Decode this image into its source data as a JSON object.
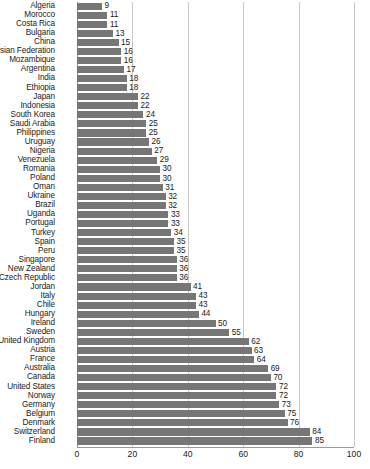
{
  "chart_data": {
    "type": "bar",
    "orientation": "horizontal",
    "title": "",
    "subtitle": "",
    "xlabel": "",
    "ylabel": "",
    "xlim": [
      0,
      100
    ],
    "xticks": [
      0,
      20,
      40,
      60,
      80,
      100
    ],
    "grid": true,
    "legend": null,
    "bar_color": "#767676",
    "gridline_color": "#c8c8c8",
    "axis_color": "#9a9a9a",
    "show_value_labels": true,
    "categories": [
      "Algeria",
      "Morocco",
      "Costa Rica",
      "Bulgaria",
      "China",
      "Russian Federation",
      "Mozambique",
      "Argentina",
      "India",
      "Ethiopia",
      "Japan",
      "Indonesia",
      "South Korea",
      "Saudi Arabia",
      "Philippines",
      "Uruguay",
      "Nigeria",
      "Venezuela",
      "Romania",
      "Poland",
      "Oman",
      "Ukraine",
      "Brazil",
      "Uganda",
      "Portugal",
      "Turkey",
      "Spain",
      "Peru",
      "Singapore",
      "New Zealand",
      "Czech Republic",
      "Jordan",
      "Italy",
      "Chile",
      "Hungary",
      "Ireland",
      "Sweden",
      "United Kingdom",
      "Austria",
      "France",
      "Australia",
      "Canada",
      "United States",
      "Norway",
      "Germany",
      "Belgium",
      "Denmark",
      "Switzerland",
      "Finland"
    ],
    "values": [
      9,
      11,
      11,
      13,
      15,
      16,
      16,
      17,
      18,
      18,
      22,
      22,
      24,
      25,
      25,
      26,
      27,
      29,
      30,
      30,
      31,
      32,
      32,
      33,
      33,
      34,
      35,
      35,
      36,
      36,
      36,
      41,
      43,
      43,
      44,
      50,
      55,
      62,
      63,
      64,
      69,
      70,
      72,
      72,
      73,
      75,
      76,
      84,
      85
    ],
    "value_labels": [
      "9",
      "11",
      "11",
      "13",
      "15",
      "16",
      "16",
      "17",
      "18",
      "18",
      "22",
      "22",
      "24",
      "25",
      "25",
      "26",
      "27",
      "29",
      "30",
      "30",
      "31",
      "32",
      "32",
      "33",
      "33",
      "34",
      "35",
      "35",
      "36",
      "36",
      "36",
      "41",
      "43",
      "43",
      "44",
      "50",
      "55",
      "62",
      "63",
      "64",
      "69",
      "70",
      "72",
      "72",
      "73",
      "75",
      "76",
      "84",
      "85"
    ],
    "xtick_labels": [
      "0",
      "20",
      "40",
      "60",
      "80",
      "100"
    ]
  }
}
